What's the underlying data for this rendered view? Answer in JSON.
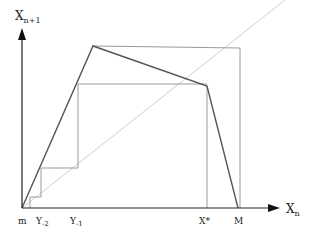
{
  "diagram": {
    "axes": {
      "y_label_main": "X",
      "y_label_sub": "n+1",
      "x_label_main": "X",
      "x_label_sub": "n"
    },
    "x_ticks": {
      "m": "m",
      "y_minus2_main": "Y",
      "y_minus2_sub": "-2",
      "y_minus1_main": "Y",
      "y_minus1_sub": "-1",
      "xstar": "X*",
      "M": "M"
    },
    "colors": {
      "axis": "#222222",
      "map_curve": "#555555",
      "diagonal": "#cccccc",
      "cobweb": "#999999"
    },
    "map_points": [
      [
        22,
        208
      ],
      [
        93,
        46
      ],
      [
        207,
        86
      ],
      [
        238,
        208
      ]
    ],
    "diagonal": [
      [
        22,
        208
      ],
      [
        290,
        -5
      ]
    ],
    "cobweb_paths": [
      "41,208 41,197 41,168 78,168 78,84 207,84",
      "93,46 240,48 240,208",
      "207,84 207,208"
    ]
  }
}
